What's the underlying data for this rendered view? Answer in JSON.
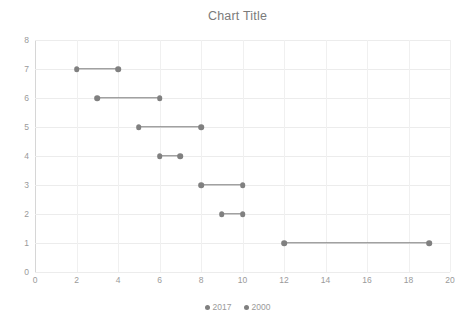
{
  "chart_data": {
    "type": "scatter",
    "subtype": "dumbbell",
    "title": "Chart Title",
    "xlabel": "",
    "ylabel": "",
    "xlim": [
      0,
      20
    ],
    "ylim": [
      0,
      8
    ],
    "x_ticks": [
      0,
      2,
      4,
      6,
      8,
      10,
      12,
      14,
      16,
      18,
      20
    ],
    "y_ticks": [
      0,
      1,
      2,
      3,
      4,
      5,
      6,
      7,
      8
    ],
    "grid": true,
    "legend_position": "bottom",
    "legend": [
      "2017",
      "2000"
    ],
    "series": [
      {
        "name": "2017",
        "values": [
          12,
          9,
          8,
          6,
          5,
          3,
          2
        ]
      },
      {
        "name": "2000",
        "values": [
          19,
          10,
          10,
          7,
          8,
          6,
          4
        ]
      }
    ],
    "categories": [
      1,
      2,
      3,
      4,
      5,
      6,
      7
    ],
    "points": [
      {
        "y": 7,
        "start": 2,
        "end": 4
      },
      {
        "y": 6,
        "start": 3,
        "end": 6
      },
      {
        "y": 5,
        "start": 5,
        "end": 8
      },
      {
        "y": 4,
        "start": 6,
        "end": 7
      },
      {
        "y": 3,
        "start": 8,
        "end": 10
      },
      {
        "y": 2,
        "start": 9,
        "end": 10
      },
      {
        "y": 1,
        "start": 12,
        "end": 19
      }
    ],
    "colors": {
      "marker": "#808080",
      "connector": "#7a7a7a",
      "grid": "#ececec",
      "axis": "#d6d6d6",
      "title_text": "#7b7b7b",
      "tick_text": "#9a9a9a"
    }
  }
}
